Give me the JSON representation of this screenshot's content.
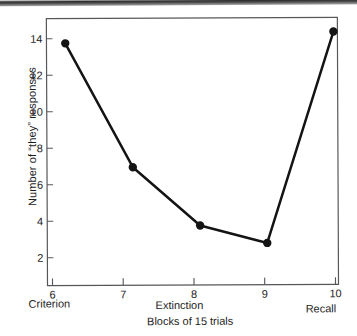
{
  "chart_data": {
    "type": "line",
    "title": "",
    "xlabel": "Blocks of 15 trials",
    "ylabel": "Number of \"they\" responses",
    "categories": [
      "6",
      "7",
      "8",
      "9",
      "10"
    ],
    "x": [
      6,
      7,
      8,
      9,
      10
    ],
    "values": [
      14.2,
      7.2,
      3.9,
      2.9,
      14.8
    ],
    "series": [
      {
        "name": "\"they\" responses",
        "values": [
          14.2,
          7.2,
          3.9,
          2.9,
          14.8
        ],
        "marker": "filled-circle",
        "color": "#141414"
      }
    ],
    "xlim": [
      5.72,
      10.06
    ],
    "ylim": [
      0.55,
      15.6
    ],
    "yticks": [
      2,
      4,
      6,
      8,
      10,
      12,
      14
    ],
    "ytick_labels": [
      "2",
      "4",
      "6",
      "8",
      "10",
      "12",
      "14"
    ],
    "xticks": [
      6,
      7,
      8,
      9,
      10
    ],
    "xtick_labels": [
      "6",
      "7",
      "8",
      "9",
      "10"
    ],
    "grid": false,
    "legend": false,
    "frame": "full-box",
    "phase_labels": [
      {
        "label": "Criterion",
        "at_x": 6
      },
      {
        "label": "Extinction",
        "at_x": 8
      },
      {
        "label": "Recall",
        "at_x": 10
      }
    ]
  },
  "axes": {
    "y_title": "Number of “they” responses",
    "x_title": "Blocks of 15 trials"
  },
  "phases": {
    "criterion": "Criterion",
    "extinction": "Extinction",
    "recall": "Recall"
  },
  "caption": {
    "fragment": ""
  },
  "colors": {
    "line": "#141414",
    "marker": "#141414",
    "frame": "#55575a",
    "text": "#1d1d1d",
    "background": "#ffffff"
  }
}
